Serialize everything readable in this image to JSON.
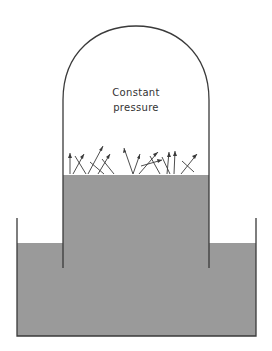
{
  "diagram": {
    "title_line1": "Constant",
    "title_line2": "pressure",
    "colors": {
      "liquid": "#9a9a9a",
      "line": "#3a3a3a",
      "background": "#ffffff"
    },
    "components": [
      "bell-jar dome",
      "inner tube liquid column",
      "outer reservoir tank",
      "vapor molecule arrows at surface"
    ]
  }
}
